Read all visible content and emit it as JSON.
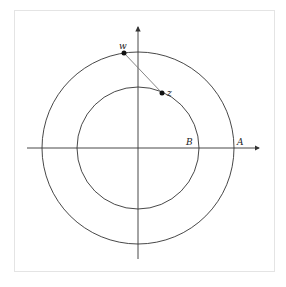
{
  "diagram": {
    "type": "complex-plane-annulus",
    "center": {
      "x": 138,
      "y": 148
    },
    "outer_circle": {
      "radius": 96,
      "label": "A"
    },
    "inner_circle": {
      "radius": 61,
      "label": "B"
    },
    "points": [
      {
        "label": "w",
        "x": 124,
        "y": 53
      },
      {
        "label": "z",
        "x": 162,
        "y": 93
      }
    ],
    "segment": {
      "from": "w",
      "to": "z"
    },
    "labels": {
      "w": "w",
      "z": "z",
      "A": "A",
      "B": "B"
    },
    "colors": {
      "line": "#333333",
      "segment": "#777777",
      "point": "#111111",
      "frame": "#e4e4e4"
    }
  }
}
